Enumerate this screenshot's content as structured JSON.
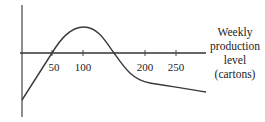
{
  "chart_data": {
    "type": "line",
    "title": "",
    "xlabel": "Weekly production level (cartons)",
    "xlabel_lines": [
      "Weekly",
      "production",
      "level",
      "(cartons)"
    ],
    "ylabel": "",
    "x_ticks": [
      50,
      100,
      200,
      250
    ],
    "x_tick_labels": [
      "50",
      "100",
      "200",
      "250"
    ],
    "xlim": [
      0,
      300
    ],
    "y_ticks": [],
    "grid": false,
    "legend": null,
    "series": [
      {
        "name": "curve",
        "x": [
          0,
          25,
          50,
          75,
          100,
          125,
          150,
          175,
          200,
          225,
          250,
          300
        ],
        "y": [
          -0.78,
          -0.4,
          0.0,
          0.35,
          0.45,
          0.3,
          0.0,
          -0.3,
          -0.47,
          -0.52,
          -0.56,
          -0.64
        ]
      }
    ],
    "annotations": [
      "Curve crosses horizontal axis at 50 and approximately 150",
      "Maximum near 100",
      "Curve starts below axis at 0 and decreases slowly after 200"
    ]
  },
  "colors": {
    "axis": "#333333",
    "curve": "#3a3a3a",
    "text": "#222222",
    "background": "#ffffff"
  }
}
